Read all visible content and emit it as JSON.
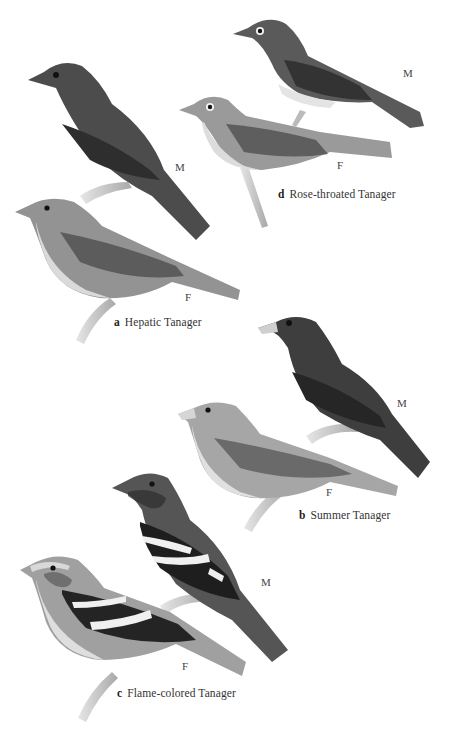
{
  "plate": {
    "species": [
      {
        "letter": "a",
        "name": "Hepatic Tanager",
        "male_label": "M",
        "female_label": "F"
      },
      {
        "letter": "b",
        "name": "Summer Tanager",
        "male_label": "M",
        "female_label": "F"
      },
      {
        "letter": "c",
        "name": "Flame-colored Tanager",
        "male_label": "M",
        "female_label": "F"
      },
      {
        "letter": "d",
        "name": "Rose-throated Tanager",
        "male_label": "M",
        "female_label": "F"
      }
    ]
  },
  "colors": {
    "background": "#ffffff",
    "male_dark": "#4a4a4a",
    "female_mid": "#8c8c8c",
    "belly_light": "#d8d8d8",
    "wing_black": "#1e1e1e",
    "branch": "#c9c9c9"
  }
}
